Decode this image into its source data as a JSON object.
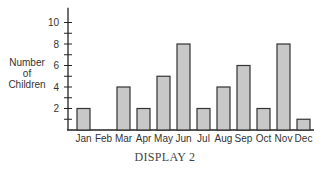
{
  "chart_data": {
    "type": "bar",
    "title": "",
    "caption": "DISPLAY 2",
    "xlabel": "",
    "ylabel": [
      "Number",
      "of",
      "Children"
    ],
    "categories": [
      "Jan",
      "Feb",
      "Mar",
      "Apr",
      "May",
      "Jun",
      "Jul",
      "Aug",
      "Sep",
      "Oct",
      "Nov",
      "Dec"
    ],
    "values": [
      2,
      0,
      4,
      2,
      5,
      8,
      2,
      4,
      6,
      2,
      8,
      1
    ],
    "ylim": [
      0,
      11
    ],
    "y_ticks_labeled": [
      2,
      4,
      6,
      8,
      10
    ],
    "y_minor_ticks": [
      1,
      3,
      5,
      7,
      9
    ],
    "grid": false,
    "legend": null,
    "colors": {
      "bar_fill": "#c8c8c8",
      "bar_stroke": "#333333",
      "axis": "#222222"
    }
  }
}
